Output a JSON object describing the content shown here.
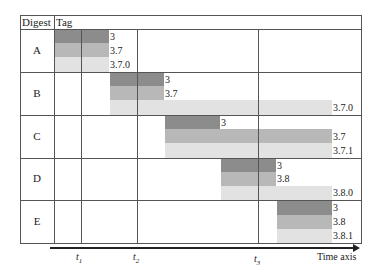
{
  "header": {
    "digest": "Digest",
    "tag": "Tag"
  },
  "rows": [
    {
      "label": "A",
      "tags": [
        "3",
        "3.7",
        "3.7.0"
      ]
    },
    {
      "label": "B",
      "tags": [
        "3",
        "3.7",
        "3.7.0"
      ]
    },
    {
      "label": "C",
      "tags": [
        "3",
        "3.7",
        "3.7.1"
      ]
    },
    {
      "label": "D",
      "tags": [
        "3",
        "3.8",
        "3.8.0"
      ]
    },
    {
      "label": "E",
      "tags": [
        "3",
        "3.8",
        "3.8.1"
      ]
    }
  ],
  "axis": {
    "label": "Time axis",
    "ticks": [
      {
        "name": "t",
        "sub": "1"
      },
      {
        "name": "t",
        "sub": "2"
      },
      {
        "name": "t",
        "sub": "3"
      }
    ]
  },
  "colors": {
    "dark": "#8c8c8c",
    "mid": "#b8b8b8",
    "light": "#e2e2e2",
    "grid": "#555555"
  }
}
